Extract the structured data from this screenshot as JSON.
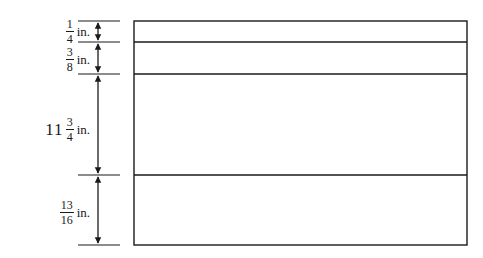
{
  "diagram": {
    "type": "dimensioned-layout",
    "stroke_color": "#1a1a1a",
    "rectangle": {
      "x": 134,
      "y": 21,
      "width": 333,
      "height": 224
    },
    "dividers_y": [
      42,
      74,
      175
    ],
    "sections": [
      {
        "whole": "",
        "num": "1",
        "den": "4",
        "unit": "in.",
        "top": 21,
        "bottom": 42
      },
      {
        "whole": "",
        "num": "3",
        "den": "8",
        "unit": "in.",
        "top": 42,
        "bottom": 74
      },
      {
        "whole": "11",
        "num": "3",
        "den": "4",
        "unit": "in.",
        "top": 74,
        "bottom": 175
      },
      {
        "whole": "",
        "num": "13",
        "den": "16",
        "unit": "in.",
        "top": 175,
        "bottom": 245
      }
    ]
  }
}
